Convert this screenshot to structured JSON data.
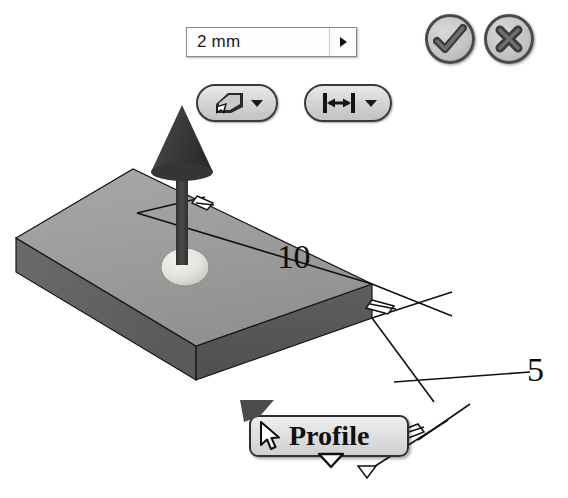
{
  "app": {
    "context": "3d-cad-extrude-handle"
  },
  "value_input": {
    "name": "extrude-distance",
    "value": "2 mm",
    "placeholder": "2 mm",
    "spinner_icon": "chevron-right-icon"
  },
  "toolbar": {
    "buttons": [
      {
        "id": "direction",
        "icon": "extrude-direction-icon",
        "dropdown_icon": "chevron-down-icon",
        "tooltip": "Direction"
      },
      {
        "id": "extent",
        "icon": "distance-extent-icon",
        "dropdown_icon": "chevron-down-icon",
        "tooltip": "Extent"
      }
    ]
  },
  "actions": {
    "ok": {
      "icon": "check-icon",
      "label": "OK"
    },
    "cancel": {
      "icon": "close-x-icon",
      "label": "Cancel"
    }
  },
  "model": {
    "dimensions": [
      {
        "id": "length",
        "value": "10"
      },
      {
        "id": "width",
        "value": "5"
      }
    ],
    "handle_icon": "extrude-arrow-handle",
    "base_handle_icon": "sphere-handle-icon"
  },
  "tooltip": {
    "cursor_icon": "mouse-pointer-icon",
    "text": "Profile",
    "pointer_icon": "tooltip-tail-icon"
  },
  "colors": {
    "top_face": "#9d9d9d",
    "front_face": "#585858",
    "side_face": "#6e6e6e",
    "outline": "#111111",
    "arrow_dark": "#3d3d3d",
    "sphere": "#e4e2dd",
    "button_face": "#d2d2d2",
    "button_border": "#3a3a3a",
    "text": "#0d0d0d"
  }
}
